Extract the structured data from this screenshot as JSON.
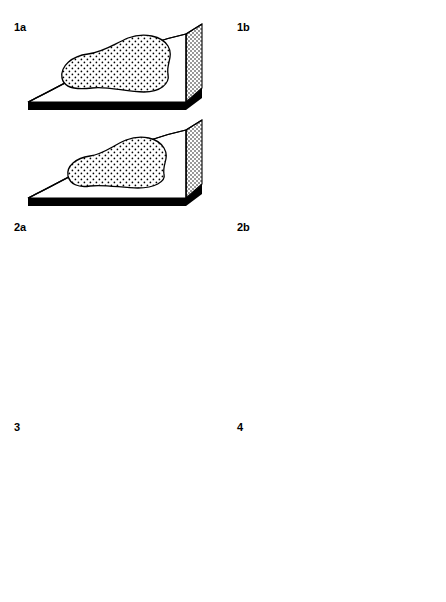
{
  "figure": {
    "title": "",
    "background_color": "#ffffff",
    "width": 446,
    "height": 602,
    "ink_color": "#000000"
  },
  "panels": [
    {
      "id": "1a",
      "label": "1a",
      "column": "left",
      "row": 1,
      "label_x": 14,
      "label_y": 22,
      "blocks": [
        {
          "position": "upper",
          "patches": [
            {
              "name": "large-stippled-patch",
              "fill_pattern": "stipple-dots"
            }
          ]
        },
        {
          "position": "lower",
          "patches": [
            {
              "name": "large-stippled-patch",
              "fill_pattern": "stipple-dots"
            }
          ]
        }
      ]
    },
    {
      "id": "1b",
      "label": "1b",
      "column": "right",
      "row": 1,
      "label_x": 237,
      "label_y": 22,
      "blocks": [
        {
          "position": "upper",
          "patches": [
            {
              "name": "stippled-patch",
              "fill_pattern": "stipple-dots"
            },
            {
              "name": "stippled-patch",
              "fill_pattern": "stipple-dots"
            },
            {
              "name": "stippled-patch",
              "fill_pattern": "stipple-dots"
            },
            {
              "name": "stippled-patch",
              "fill_pattern": "stipple-dots"
            },
            {
              "name": "stippled-patch",
              "fill_pattern": "stipple-dots"
            }
          ]
        },
        {
          "position": "lower",
          "patches": [
            {
              "name": "stippled-patch",
              "fill_pattern": "stipple-dots"
            },
            {
              "name": "stippled-patch",
              "fill_pattern": "stipple-dots"
            },
            {
              "name": "stippled-patch",
              "fill_pattern": "stipple-dots"
            },
            {
              "name": "stippled-patch",
              "fill_pattern": "stipple-dots"
            }
          ]
        }
      ]
    },
    {
      "id": "2a",
      "label": "2a",
      "column": "left",
      "row": 2,
      "label_x": 14,
      "label_y": 222,
      "blocks": [
        {
          "position": "upper",
          "patches": [
            {
              "name": "mixed-symbol-patch",
              "fill_pattern": "filled-circles-open-triangles"
            },
            {
              "name": "mixed-symbol-patch",
              "fill_pattern": "filled-circles"
            },
            {
              "name": "mixed-symbol-patch",
              "fill_pattern": "filled-circles-open-triangles"
            },
            {
              "name": "mixed-symbol-patch",
              "fill_pattern": "filled-circles"
            },
            {
              "name": "mixed-symbol-patch",
              "fill_pattern": "filled-circles-filled-triangles"
            },
            {
              "name": "mixed-symbol-patch",
              "fill_pattern": "open-triangles-filled-triangles"
            },
            {
              "name": "mixed-symbol-patch",
              "fill_pattern": "filled-triangles"
            },
            {
              "name": "mixed-symbol-patch",
              "fill_pattern": "filled-triangles"
            }
          ]
        },
        {
          "position": "lower",
          "patches": [
            {
              "name": "filled-circle-patch",
              "fill_pattern": "filled-circles"
            },
            {
              "name": "open-triangle-patch",
              "fill_pattern": "open-triangles"
            },
            {
              "name": "open-triangle-patch",
              "fill_pattern": "open-triangles"
            },
            {
              "name": "filled-triangle-patch",
              "fill_pattern": "filled-triangles"
            },
            {
              "name": "filled-triangle-patch",
              "fill_pattern": "filled-triangles"
            }
          ]
        }
      ]
    },
    {
      "id": "2b",
      "label": "2b",
      "column": "right",
      "row": 2,
      "label_x": 237,
      "label_y": 222,
      "blocks": [
        {
          "position": "upper",
          "patches": [
            {
              "name": "mixed-symbol-patch",
              "fill_pattern": "filled-circles-open-triangles"
            },
            {
              "name": "mixed-symbol-patch",
              "fill_pattern": "filled-circles-filled-triangles-open-triangles"
            },
            {
              "name": "mixed-symbol-patch",
              "fill_pattern": "filled-triangles-open-triangles"
            }
          ]
        },
        {
          "position": "lower",
          "patches": [
            {
              "name": "filled-circle-patch",
              "fill_pattern": "filled-circles"
            },
            {
              "name": "filled-triangle-patch",
              "fill_pattern": "filled-triangles"
            },
            {
              "name": "open-triangle-patch",
              "fill_pattern": "open-triangles"
            }
          ]
        }
      ]
    },
    {
      "id": "3",
      "label": "3",
      "column": "left",
      "row": 3,
      "label_x": 14,
      "label_y": 422,
      "blocks": [
        {
          "position": "upper",
          "patches": [
            {
              "name": "mixed-symbol-patch",
              "fill_pattern": "circles-triangles-squares"
            },
            {
              "name": "mixed-symbol-patch",
              "fill_pattern": "circles-triangles-squares"
            },
            {
              "name": "mixed-symbol-patch",
              "fill_pattern": "circles-triangles-squares"
            },
            {
              "name": "mixed-symbol-patch",
              "fill_pattern": "circles-triangles-squares"
            },
            {
              "name": "mixed-symbol-patch",
              "fill_pattern": "circles-triangles-squares"
            }
          ]
        },
        {
          "position": "lower",
          "patches": [
            {
              "name": "mixed-symbol-patch",
              "fill_pattern": "circles-triangles-squares"
            },
            {
              "name": "mixed-symbol-patch",
              "fill_pattern": "circles-triangles-squares"
            },
            {
              "name": "mixed-symbol-patch",
              "fill_pattern": "filled-circles"
            },
            {
              "name": "mixed-symbol-patch",
              "fill_pattern": "circles-triangles-squares"
            }
          ]
        }
      ]
    },
    {
      "id": "4",
      "label": "4",
      "column": "right",
      "row": 3,
      "label_x": 237,
      "label_y": 422,
      "blocks": [
        {
          "position": "upper",
          "patches": [
            {
              "name": "empty-patch",
              "fill_pattern": "none"
            },
            {
              "name": "empty-patch",
              "fill_pattern": "none"
            },
            {
              "name": "empty-patch",
              "fill_pattern": "none"
            },
            {
              "name": "empty-patch",
              "fill_pattern": "none"
            },
            {
              "name": "empty-patch",
              "fill_pattern": "none"
            },
            {
              "name": "star-patch",
              "fill_pattern": "stars"
            }
          ]
        },
        {
          "position": "lower",
          "patches": [
            {
              "name": "empty-patch",
              "fill_pattern": "none"
            },
            {
              "name": "empty-patch",
              "fill_pattern": "none"
            },
            {
              "name": "empty-patch",
              "fill_pattern": "none"
            },
            {
              "name": "empty-patch",
              "fill_pattern": "none"
            },
            {
              "name": "empty-patch",
              "fill_pattern": "none"
            }
          ]
        }
      ]
    }
  ],
  "symbol_legend": {
    "stipple-dots": "fine stippled dot fill",
    "filled-circles": "solid black circles",
    "filled-triangles": "solid black triangles",
    "open-triangles": "outlined triangles",
    "open-squares": "outlined squares",
    "stars": "eight-pointed stars / asterisks",
    "none": "blank (unfilled) patch"
  },
  "block_style": {
    "top_surface": "white",
    "base_slab": "#000000",
    "side_face": "dotted-hatch",
    "outline": "#000000"
  }
}
